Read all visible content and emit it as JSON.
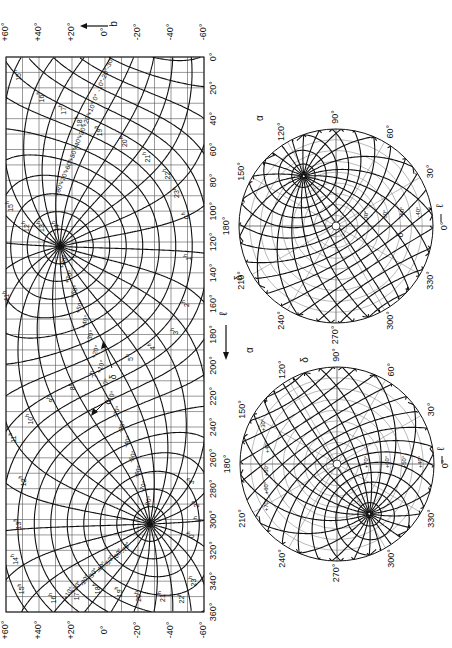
{
  "figure": {
    "main_chart": {
      "x_axis_symbol": "ℓ",
      "y_axis_symbol": "b",
      "l_ticks": [
        "0°",
        "20°",
        "40°",
        "60°",
        "80°",
        "100°",
        "120°",
        "140°",
        "160°",
        "180°",
        "200°",
        "220°",
        "240°",
        "260°",
        "280°",
        "300°",
        "320°",
        "340°",
        "360°"
      ],
      "b_ticks_top": [
        "+60°",
        "+40°",
        "+20°",
        "0°",
        "-20°",
        "-40°",
        "-60°"
      ],
      "b_ticks_bottom": [
        "+60°",
        "+40°",
        "+20°",
        "0°",
        "-20°",
        "-40°",
        "-60°"
      ],
      "alpha_symbol": "α",
      "delta_symbol": "δ",
      "north_pole_ra_labels": [
        "12h",
        "13h",
        "14h"
      ],
      "hour_labels": [
        {
          "t": "15h",
          "l": 12,
          "b": 52
        },
        {
          "t": "16h",
          "l": 26,
          "b": 38
        },
        {
          "t": "17h",
          "l": 34,
          "b": 25
        },
        {
          "t": "18h",
          "l": 42,
          "b": 15
        },
        {
          "t": "19h",
          "l": 48,
          "b": 3
        },
        {
          "t": "20h",
          "l": 55,
          "b": -12
        },
        {
          "t": "21h",
          "l": 65,
          "b": -26
        },
        {
          "t": "22h",
          "l": 76,
          "b": -38
        },
        {
          "t": "23h",
          "l": 88,
          "b": -44
        },
        {
          "t": "0h",
          "l": 103,
          "b": -50
        },
        {
          "t": "1h",
          "l": 130,
          "b": -51
        },
        {
          "t": "2h",
          "l": 160,
          "b": -50
        },
        {
          "t": "3h",
          "l": 178,
          "b": -43
        },
        {
          "t": "4h",
          "l": 188,
          "b": -29
        },
        {
          "t": "5h",
          "l": 195,
          "b": -16
        },
        {
          "t": "7h",
          "l": 206,
          "b": 6
        },
        {
          "t": "8h",
          "l": 214,
          "b": 19
        },
        {
          "t": "9h",
          "l": 222,
          "b": 32
        },
        {
          "t": "10h",
          "l": 235,
          "b": 45
        },
        {
          "t": "11h",
          "l": 247,
          "b": 55
        },
        {
          "t": "12h",
          "l": 275,
          "b": 49
        },
        {
          "t": "13h",
          "l": 303,
          "b": 52
        },
        {
          "t": "14h",
          "l": 326,
          "b": 54
        },
        {
          "t": "15h",
          "l": 345,
          "b": 50
        },
        {
          "t": "16h",
          "l": 351,
          "b": 31
        },
        {
          "t": "17h",
          "l": 349,
          "b": 17
        },
        {
          "t": "18h",
          "l": 345,
          "b": 4
        },
        {
          "t": "19h",
          "l": 347,
          "b": -9
        },
        {
          "t": "20h",
          "l": 350,
          "b": -21
        },
        {
          "t": "21h",
          "l": 350,
          "b": -35
        },
        {
          "t": "22h",
          "l": 351,
          "b": -47
        },
        {
          "t": "23h",
          "l": 340,
          "b": -54
        },
        {
          "t": "0h",
          "l": 310,
          "b": -53
        },
        {
          "t": "1h",
          "l": 300,
          "b": -57
        },
        {
          "t": "2h",
          "l": 290,
          "b": -56
        },
        {
          "t": "3h",
          "l": 275,
          "b": -53
        },
        {
          "t": "15h",
          "l": 97,
          "b": 57
        },
        {
          "t": "11h",
          "l": 155,
          "b": 59
        },
        {
          "t": "12h",
          "l": 110,
          "b": 47
        },
        {
          "t": "13h",
          "l": 110,
          "b": 38
        },
        {
          "t": "14h",
          "l": 110,
          "b": 29
        }
      ],
      "dec_labels_top": [
        "-30°",
        "-20°",
        "-10°",
        "0°",
        "+10°",
        "+20°",
        "+30°",
        "+40°",
        "+50°",
        "+60°",
        "+70°",
        "+80°"
      ],
      "dec_labels_mid": [
        "+80°",
        "+70°",
        "+60°",
        "+50°",
        "+40°",
        "+30°",
        "+20°",
        "+10°",
        "0°",
        "-10°",
        "-20°",
        "-30°",
        "-40°",
        "-50°",
        "-60°",
        "-70°",
        "-80°"
      ],
      "dec_labels_bottom": [
        "-70°",
        "-60°",
        "-50°",
        "-40°",
        "-30°",
        "-20°",
        "-10°",
        "+10°"
      ]
    },
    "circle_top": {
      "rim_labels": [
        "0°",
        "30°",
        "60°",
        "90°",
        "120°",
        "150°",
        "180°",
        "210°",
        "240°",
        "270°",
        "300°",
        "330°"
      ],
      "x_axis_symbol": "ℓ",
      "alpha_symbol": "α",
      "delta_symbol": "δ",
      "inner_labels": [
        "-10°",
        "-20°",
        "-30°",
        "-40°",
        "-50°",
        "-60°",
        "-70°",
        "-80°",
        "-90°",
        "+10°",
        "+20°",
        "0°",
        "1h",
        "2h",
        "3h",
        "4h",
        "5h",
        "21h",
        "22h",
        "23h"
      ]
    },
    "circle_bottom": {
      "rim_labels": [
        "0°",
        "30°",
        "60°",
        "90°",
        "120°",
        "150°",
        "180°",
        "210°",
        "240°",
        "270°",
        "300°",
        "330°"
      ],
      "x_axis_symbol": "ℓ",
      "alpha_symbol": "α",
      "delta_symbol": "δ",
      "inner_labels": [
        "+10°",
        "+20°",
        "+30°",
        "+40°",
        "+50°",
        "+60°",
        "+70°",
        "-10°",
        "0°",
        "8h",
        "9h",
        "10h",
        "11h",
        "12h",
        "13h",
        "14h",
        "15h",
        "16h",
        "17h"
      ]
    },
    "colors": {
      "ink": "#111111",
      "grid_light": "#555555",
      "circle_light": "#8a8a8a",
      "background": "#ffffff"
    }
  }
}
